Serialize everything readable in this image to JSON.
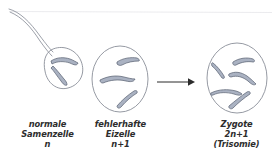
{
  "diagram": {
    "background_color": "#ffffff",
    "ink_color": "#8a8f99",
    "chromosome_fill": "#aab2c2",
    "chromosome_stroke": "#5d6676",
    "arrow_color": "#2b2b2b",
    "text_color": "#2d2d2d"
  },
  "cells": {
    "sperm": {
      "label": "normale\nSamenzelle\nn",
      "name_line": "normale",
      "type_line": "Samenzelle",
      "ploidy": "n",
      "chromosome_count": 2
    },
    "egg": {
      "label": "fehlerhafte\nEizelle\nn+1",
      "name_line": "fehlerhafte",
      "type_line": "Eizelle",
      "ploidy": "n+1",
      "chromosome_count": 3
    },
    "zygote": {
      "label": "Zygote\n2n+1\n(Trisomie)",
      "name_line": "Zygote",
      "ploidy": "2n+1",
      "condition": "(Trisomie)",
      "chromosome_count": 5
    }
  },
  "arrow": {
    "direction": "right",
    "from": "egg",
    "to": "zygote"
  }
}
